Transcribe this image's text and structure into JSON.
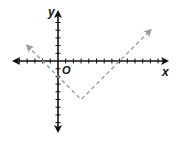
{
  "chart_data": {
    "type": "line",
    "title": "",
    "xlabel": "x",
    "ylabel": "y",
    "origin_label": "O",
    "function": "y = |x - 3| - 5",
    "line_style": "dashed",
    "line_color": "#9a9a9a",
    "axis_color": "#111111",
    "grid": false,
    "xlim": [
      -6,
      14
    ],
    "ylim": [
      -8,
      6
    ],
    "tick_spacing": 1,
    "series": [
      {
        "name": "absolute value graph",
        "x": [
          -4,
          3,
          12
        ],
        "y": [
          2,
          -5,
          4
        ]
      }
    ],
    "vertex": [
      3,
      -5
    ],
    "x_intercepts": [
      -2,
      8
    ],
    "y_intercept": -2
  },
  "labels": {
    "x": "x",
    "y": "y",
    "origin": "O"
  }
}
